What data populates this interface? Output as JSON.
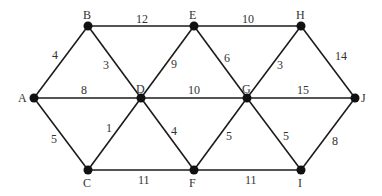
{
  "diagram": {
    "type": "weighted-undirected-graph",
    "nodes": [
      {
        "id": "A",
        "x": 34,
        "y": 98,
        "lx": 18,
        "ly": 102
      },
      {
        "id": "B",
        "x": 88,
        "y": 26,
        "lx": 83,
        "ly": 19
      },
      {
        "id": "E",
        "x": 194,
        "y": 26,
        "lx": 189,
        "ly": 19
      },
      {
        "id": "H",
        "x": 301,
        "y": 26,
        "lx": 296,
        "ly": 19
      },
      {
        "id": "D",
        "x": 141,
        "y": 98,
        "lx": 136,
        "ly": 93
      },
      {
        "id": "G",
        "x": 247,
        "y": 98,
        "lx": 242,
        "ly": 93
      },
      {
        "id": "J",
        "x": 355,
        "y": 98,
        "lx": 361,
        "ly": 102
      },
      {
        "id": "C",
        "x": 88,
        "y": 170,
        "lx": 83,
        "ly": 187
      },
      {
        "id": "F",
        "x": 194,
        "y": 170,
        "lx": 189,
        "ly": 187
      },
      {
        "id": "I",
        "x": 301,
        "y": 170,
        "lx": 298,
        "ly": 187
      }
    ],
    "edges": [
      {
        "from": "A",
        "to": "B",
        "weight": "4",
        "lx": 52,
        "ly": 59
      },
      {
        "from": "A",
        "to": "D",
        "weight": "8",
        "lx": 81,
        "ly": 94
      },
      {
        "from": "A",
        "to": "C",
        "weight": "5",
        "lx": 51,
        "ly": 143
      },
      {
        "from": "B",
        "to": "E",
        "weight": "12",
        "lx": 136,
        "ly": 23
      },
      {
        "from": "B",
        "to": "D",
        "weight": "3",
        "lx": 103,
        "ly": 69
      },
      {
        "from": "E",
        "to": "D",
        "weight": "9",
        "lx": 171,
        "ly": 68
      },
      {
        "from": "E",
        "to": "H",
        "weight": "10",
        "lx": 242,
        "ly": 23
      },
      {
        "from": "E",
        "to": "G",
        "weight": "6",
        "lx": 224,
        "ly": 62
      },
      {
        "from": "H",
        "to": "G",
        "weight": "3",
        "lx": 277,
        "ly": 69
      },
      {
        "from": "H",
        "to": "J",
        "weight": "14",
        "lx": 335,
        "ly": 60
      },
      {
        "from": "D",
        "to": "G",
        "weight": "10",
        "lx": 188,
        "ly": 94
      },
      {
        "from": "G",
        "to": "J",
        "weight": "15",
        "lx": 297,
        "ly": 94
      },
      {
        "from": "D",
        "to": "C",
        "weight": "1",
        "lx": 106,
        "ly": 132
      },
      {
        "from": "D",
        "to": "F",
        "weight": "4",
        "lx": 171,
        "ly": 135
      },
      {
        "from": "C",
        "to": "F",
        "weight": "11",
        "lx": 138,
        "ly": 184
      },
      {
        "from": "F",
        "to": "G",
        "weight": "5",
        "lx": 226,
        "ly": 140
      },
      {
        "from": "G",
        "to": "I",
        "weight": "5",
        "lx": 283,
        "ly": 140
      },
      {
        "from": "I",
        "to": "J",
        "weight": "8",
        "lx": 332,
        "ly": 145
      },
      {
        "from": "F",
        "to": "I",
        "weight": "11",
        "lx": 245,
        "ly": 184
      }
    ]
  }
}
